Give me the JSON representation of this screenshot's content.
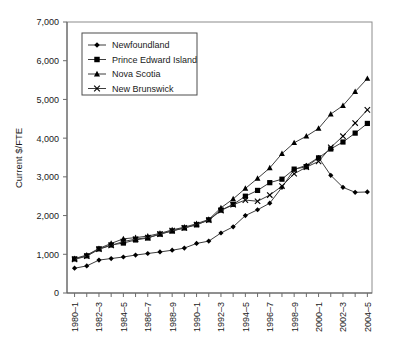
{
  "chart_data": {
    "type": "line",
    "title": "",
    "xlabel": "",
    "ylabel": "Current $/FTE",
    "ylim": [
      0,
      7000
    ],
    "ytick_values": [
      0,
      1000,
      2000,
      3000,
      4000,
      5000,
      6000,
      7000
    ],
    "ytick_labels": [
      "0",
      "1,000",
      "2,000",
      "3,000",
      "4,000",
      "5,000",
      "6,000",
      "7,000"
    ],
    "grid": false,
    "legend_position": "upper-left-inside",
    "categories": [
      "1980–1",
      "1981–2",
      "1982–3",
      "1983–4",
      "1984–5",
      "1985–6",
      "1986–7",
      "1987–8",
      "1988–9",
      "1989–90",
      "1990–1",
      "1991–2",
      "1992–3",
      "1993–4",
      "1994–5",
      "1995–6",
      "1996–7",
      "1997–8",
      "1998–9",
      "1999–2000",
      "2000–1",
      "2001–2",
      "2002–3",
      "2003–4",
      "2004–5"
    ],
    "xtick_labels_shown": [
      "1980–1",
      "1982–3",
      "1984–5",
      "1986–7",
      "1988–9",
      "1990–1",
      "1992–3",
      "1994–5",
      "1996–7",
      "1998–9",
      "2000–1",
      "2002–3",
      "2004–5"
    ],
    "series": [
      {
        "name": "Newfoundland",
        "marker": "diamond",
        "values": [
          640,
          700,
          850,
          890,
          930,
          980,
          1020,
          1060,
          1105,
          1160,
          1280,
          1340,
          1550,
          1710,
          2000,
          2150,
          2320,
          2730,
          3190,
          3300,
          3500,
          3040,
          2730,
          2600,
          2610
        ]
      },
      {
        "name": "Prince Edward Island",
        "marker": "square",
        "values": [
          880,
          960,
          1140,
          1240,
          1290,
          1370,
          1420,
          1520,
          1600,
          1680,
          1760,
          1890,
          2140,
          2290,
          2500,
          2650,
          2850,
          2940,
          3200,
          3260,
          3490,
          3720,
          3900,
          4130,
          4380
        ]
      },
      {
        "name": "Nova Scotia",
        "marker": "triangle",
        "values": [
          890,
          980,
          1150,
          1280,
          1400,
          1430,
          1470,
          1540,
          1630,
          1700,
          1790,
          1900,
          2200,
          2430,
          2700,
          2960,
          3230,
          3600,
          3880,
          4050,
          4250,
          4620,
          4840,
          5200,
          5540
        ]
      },
      {
        "name": "New Brunswick",
        "marker": "cross",
        "values": [
          870,
          950,
          1130,
          1230,
          1330,
          1390,
          1430,
          1520,
          1610,
          1680,
          1770,
          1880,
          2130,
          2280,
          2400,
          2370,
          2530,
          2760,
          3080,
          3250,
          3400,
          3760,
          4050,
          4390,
          4730
        ]
      }
    ],
    "final_points": {
      "Nova Scotia": 5960,
      "New Brunswick": 4730,
      "Prince Edward Island": 4380,
      "Newfoundland": 2610
    }
  },
  "legend": {
    "entries": [
      {
        "label": "Newfoundland"
      },
      {
        "label": "Prince Edward Island"
      },
      {
        "label": "Nova Scotia"
      },
      {
        "label": "New Brunswick"
      }
    ]
  }
}
